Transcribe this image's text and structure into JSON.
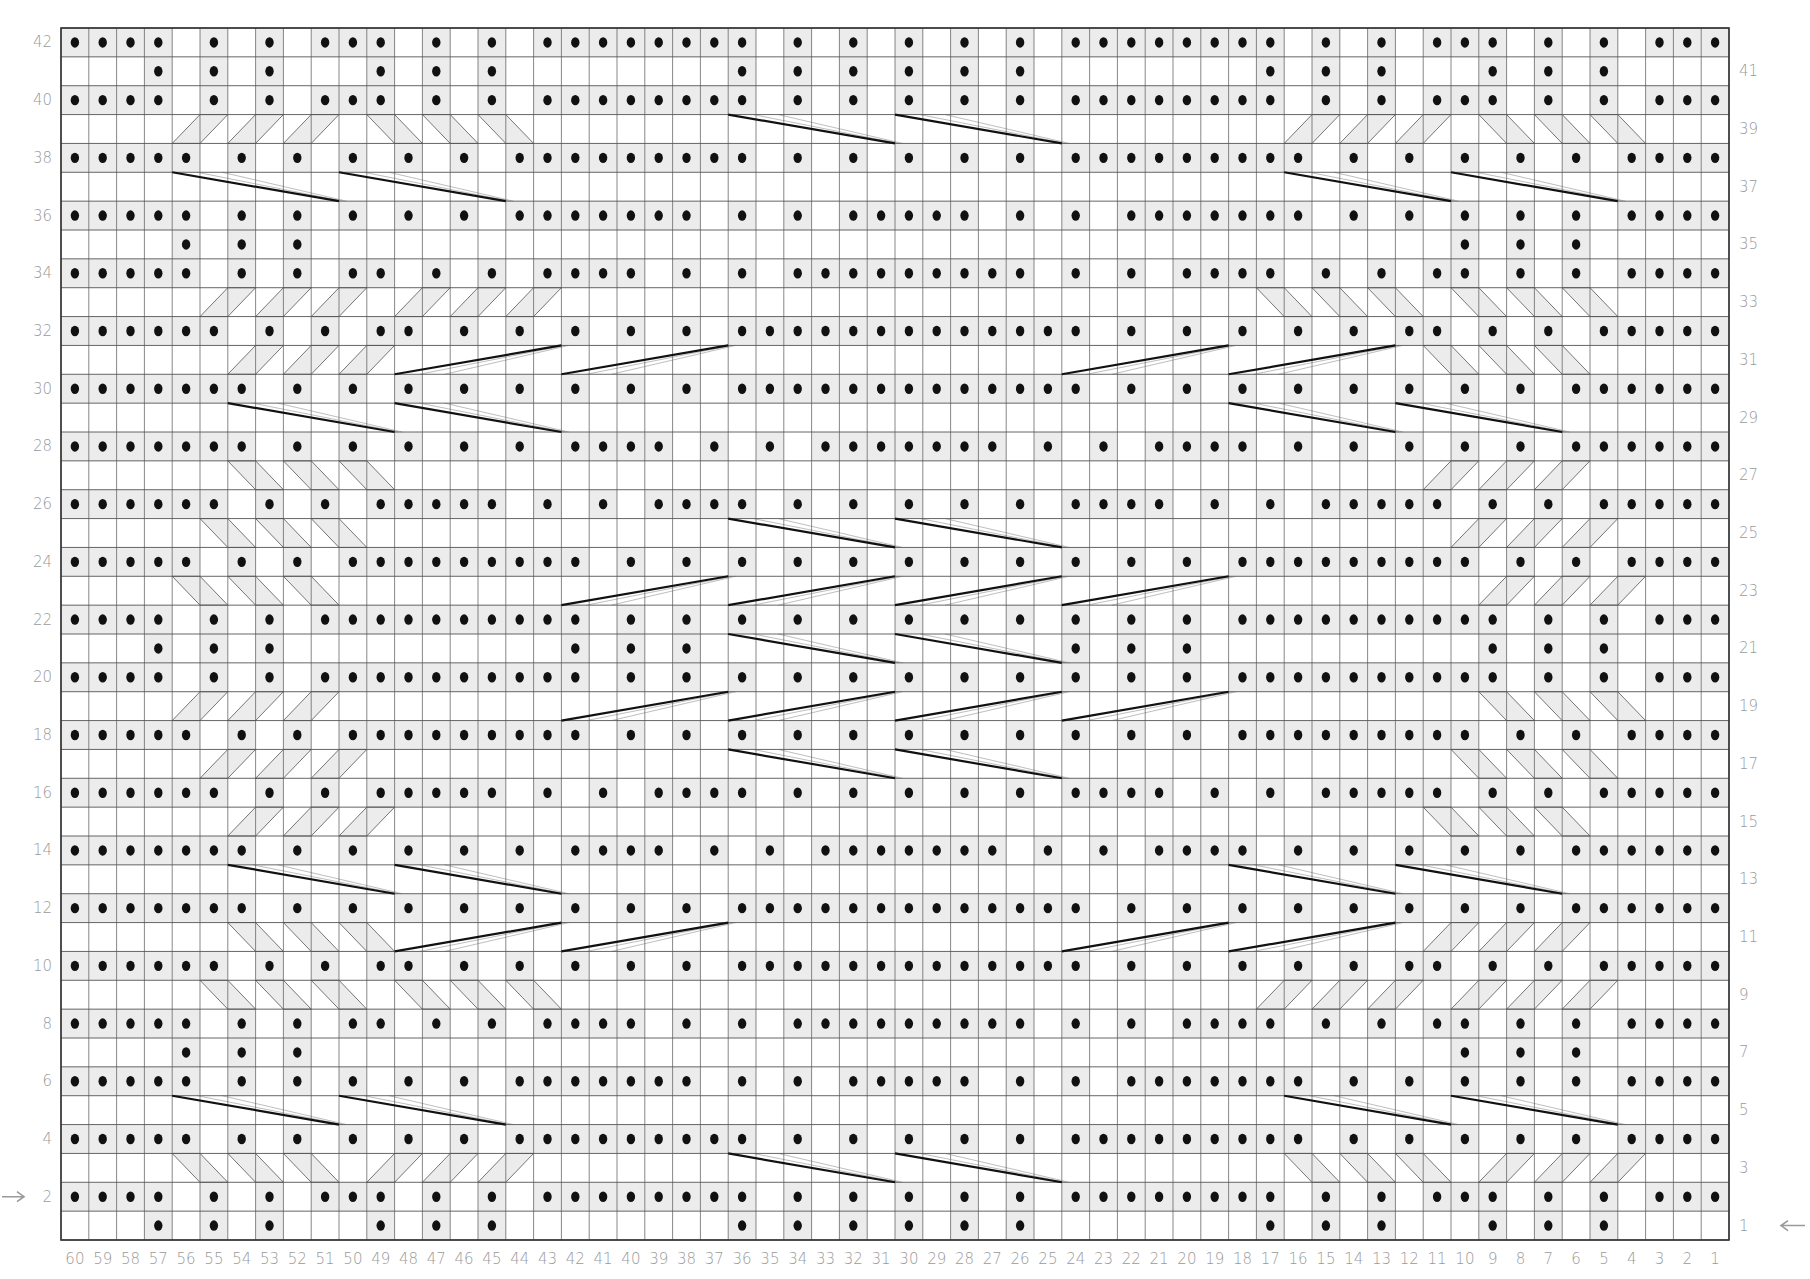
{
  "chart": {
    "type": "knitting-cable-chart",
    "columns": 60,
    "rows": 42,
    "column_labels_order": "60 at left, 1 at right",
    "even_row_labels_side": "left",
    "odd_row_labels_side": "right",
    "start_arrows": [
      {
        "row": 2,
        "side": "left",
        "direction": "right",
        "glyph": "→"
      },
      {
        "row": 1,
        "side": "right",
        "direction": "left",
        "glyph": "←"
      }
    ],
    "colors": {
      "grid_line": "#555555",
      "purl_shade": "#ececec",
      "dot": "#111111",
      "cable_line": "#666666",
      "crossing_line": "#111111",
      "label": "#9a9a9a"
    },
    "symbols": {
      "dot": "purl",
      "blank": "knit",
      "shaded_diagonal_band": "traveling purl stitch",
      "thick_line": "long cable crossing"
    }
  },
  "purl_rows": {
    "42": [
      60,
      59,
      58,
      57,
      55,
      53,
      51,
      50,
      49,
      47,
      45,
      43,
      42,
      41,
      40,
      39,
      38,
      37,
      36,
      34,
      32,
      30,
      28,
      26,
      24,
      23,
      22,
      21,
      20,
      19,
      18,
      17,
      15,
      13,
      11,
      10,
      9,
      7,
      5,
      3,
      2,
      1
    ],
    "41": [
      57,
      55,
      53,
      49,
      47,
      45,
      36,
      34,
      32,
      30,
      28,
      26,
      17,
      15,
      13,
      9,
      7,
      5
    ],
    "40": [
      60,
      59,
      58,
      57,
      55,
      53,
      51,
      50,
      49,
      47,
      45,
      43,
      42,
      41,
      40,
      39,
      38,
      37,
      36,
      34,
      32,
      30,
      28,
      26,
      24,
      23,
      22,
      21,
      20,
      19,
      18,
      17,
      15,
      13,
      11,
      10,
      9,
      7,
      5,
      3,
      2,
      1
    ],
    "39": [],
    "38": [
      60,
      59,
      58,
      57,
      56,
      54,
      52,
      50,
      48,
      46,
      44,
      43,
      42,
      41,
      40,
      39,
      38,
      37,
      36,
      34,
      32,
      30,
      28,
      26,
      24,
      23,
      22,
      21,
      20,
      19,
      18,
      17,
      16,
      14,
      12,
      10,
      8,
      6,
      4,
      3,
      2,
      1
    ],
    "37": [],
    "36": [
      60,
      59,
      58,
      57,
      56,
      54,
      52,
      50,
      48,
      46,
      44,
      43,
      42,
      41,
      40,
      39,
      38,
      36,
      34,
      32,
      31,
      30,
      29,
      28,
      26,
      24,
      22,
      21,
      20,
      19,
      18,
      17,
      16,
      14,
      12,
      10,
      8,
      6,
      4,
      3,
      2,
      1
    ],
    "35": [
      56,
      54,
      52,
      10,
      8,
      6
    ],
    "34": [
      60,
      59,
      58,
      57,
      56,
      54,
      52,
      50,
      49,
      47,
      45,
      43,
      42,
      41,
      40,
      38,
      36,
      34,
      33,
      32,
      31,
      30,
      29,
      28,
      27,
      26,
      24,
      22,
      20,
      19,
      18,
      17,
      15,
      13,
      11,
      10,
      8,
      6,
      4,
      3,
      2,
      1
    ],
    "33": [],
    "32": [
      60,
      59,
      58,
      57,
      56,
      55,
      53,
      51,
      49,
      48,
      46,
      44,
      42,
      40,
      38,
      36,
      35,
      34,
      33,
      32,
      31,
      30,
      29,
      28,
      27,
      26,
      25,
      24,
      22,
      20,
      18,
      16,
      14,
      12,
      11,
      9,
      7,
      5,
      4,
      3,
      2,
      1
    ],
    "31": [],
    "30": [
      60,
      59,
      58,
      57,
      56,
      55,
      54,
      52,
      50,
      48,
      46,
      44,
      42,
      40,
      38,
      36,
      35,
      34,
      33,
      32,
      31,
      30,
      29,
      28,
      27,
      26,
      25,
      24,
      22,
      20,
      18,
      16,
      14,
      12,
      10,
      8,
      6,
      5,
      4,
      3,
      2,
      1
    ],
    "29": [],
    "28": [
      60,
      59,
      58,
      57,
      56,
      55,
      54,
      52,
      50,
      48,
      46,
      44,
      42,
      41,
      40,
      39,
      37,
      35,
      33,
      32,
      31,
      30,
      29,
      28,
      27,
      25,
      23,
      21,
      20,
      19,
      18,
      16,
      14,
      12,
      10,
      8,
      6,
      5,
      4,
      3,
      2,
      1
    ],
    "27": [],
    "26": [
      60,
      59,
      58,
      57,
      56,
      55,
      53,
      51,
      49,
      48,
      47,
      46,
      45,
      43,
      41,
      39,
      38,
      37,
      36,
      34,
      32,
      30,
      28,
      26,
      24,
      23,
      22,
      21,
      19,
      17,
      15,
      14,
      13,
      12,
      11,
      9,
      7,
      5,
      4,
      3,
      2,
      1
    ],
    "25": [],
    "24": [
      60,
      59,
      58,
      57,
      56,
      54,
      52,
      50,
      49,
      48,
      47,
      46,
      45,
      44,
      43,
      42,
      40,
      38,
      36,
      34,
      32,
      30,
      28,
      26,
      24,
      22,
      20,
      18,
      17,
      16,
      15,
      14,
      13,
      12,
      11,
      10,
      8,
      6,
      4,
      3,
      2,
      1
    ],
    "23": [],
    "22": [
      60,
      59,
      58,
      57,
      55,
      53,
      51,
      50,
      49,
      48,
      47,
      46,
      45,
      44,
      43,
      42,
      40,
      38,
      36,
      34,
      32,
      30,
      28,
      26,
      24,
      22,
      20,
      18,
      17,
      16,
      15,
      14,
      13,
      12,
      11,
      10,
      9,
      7,
      5,
      3,
      2,
      1
    ],
    "21": [
      57,
      55,
      53,
      42,
      40,
      38,
      24,
      22,
      20,
      9,
      7,
      5
    ],
    "20": [
      60,
      59,
      58,
      57,
      55,
      53,
      51,
      50,
      49,
      48,
      47,
      46,
      45,
      44,
      43,
      42,
      40,
      38,
      36,
      34,
      32,
      30,
      28,
      26,
      24,
      22,
      20,
      18,
      17,
      16,
      15,
      14,
      13,
      12,
      11,
      10,
      9,
      7,
      5,
      3,
      2,
      1
    ],
    "19": [],
    "18": [
      60,
      59,
      58,
      57,
      56,
      54,
      52,
      50,
      49,
      48,
      47,
      46,
      45,
      44,
      43,
      42,
      40,
      38,
      36,
      34,
      32,
      30,
      28,
      26,
      24,
      22,
      20,
      18,
      17,
      16,
      15,
      14,
      13,
      12,
      11,
      10,
      8,
      6,
      4,
      3,
      2,
      1
    ],
    "17": [],
    "16": [
      60,
      59,
      58,
      57,
      56,
      55,
      53,
      51,
      49,
      48,
      47,
      46,
      45,
      43,
      41,
      39,
      38,
      37,
      36,
      34,
      32,
      30,
      28,
      26,
      24,
      23,
      22,
      21,
      19,
      17,
      15,
      14,
      13,
      12,
      11,
      9,
      7,
      5,
      4,
      3,
      2,
      1
    ],
    "15": [],
    "14": [
      60,
      59,
      58,
      57,
      56,
      55,
      54,
      52,
      50,
      48,
      46,
      44,
      42,
      41,
      40,
      39,
      37,
      35,
      33,
      32,
      31,
      30,
      29,
      28,
      27,
      25,
      23,
      21,
      20,
      19,
      18,
      16,
      14,
      12,
      10,
      8,
      6,
      5,
      4,
      3,
      2,
      1
    ],
    "13": [],
    "12": [
      60,
      59,
      58,
      57,
      56,
      55,
      54,
      52,
      50,
      48,
      46,
      44,
      42,
      40,
      38,
      36,
      35,
      34,
      33,
      32,
      31,
      30,
      29,
      28,
      27,
      26,
      25,
      24,
      22,
      20,
      18,
      16,
      14,
      12,
      10,
      8,
      6,
      5,
      4,
      3,
      2,
      1
    ],
    "11": [],
    "10": [
      60,
      59,
      58,
      57,
      56,
      55,
      53,
      51,
      49,
      48,
      46,
      44,
      42,
      40,
      38,
      36,
      35,
      34,
      33,
      32,
      31,
      30,
      29,
      28,
      27,
      26,
      25,
      24,
      22,
      20,
      18,
      16,
      14,
      12,
      11,
      9,
      7,
      5,
      4,
      3,
      2,
      1
    ],
    "9": [],
    "8": [
      60,
      59,
      58,
      57,
      56,
      54,
      52,
      50,
      49,
      47,
      45,
      43,
      42,
      41,
      40,
      38,
      36,
      34,
      33,
      32,
      31,
      30,
      29,
      28,
      27,
      26,
      24,
      22,
      20,
      19,
      18,
      17,
      15,
      13,
      11,
      10,
      8,
      6,
      4,
      3,
      2,
      1
    ],
    "7": [
      56,
      54,
      52,
      10,
      8,
      6
    ],
    "6": [
      60,
      59,
      58,
      57,
      56,
      54,
      52,
      50,
      48,
      46,
      44,
      43,
      42,
      41,
      40,
      39,
      38,
      36,
      34,
      32,
      31,
      30,
      29,
      28,
      26,
      24,
      22,
      21,
      20,
      19,
      18,
      17,
      16,
      14,
      12,
      10,
      8,
      6,
      4,
      3,
      2,
      1
    ],
    "5": [],
    "4": [
      60,
      59,
      58,
      57,
      56,
      54,
      52,
      50,
      48,
      46,
      44,
      43,
      42,
      41,
      40,
      39,
      38,
      37,
      36,
      34,
      32,
      30,
      28,
      26,
      24,
      23,
      22,
      21,
      20,
      19,
      18,
      17,
      16,
      14,
      12,
      10,
      8,
      6,
      4,
      3,
      2,
      1
    ],
    "3": [],
    "2": [
      60,
      59,
      58,
      57,
      55,
      53,
      51,
      50,
      49,
      47,
      45,
      43,
      42,
      41,
      40,
      39,
      38,
      37,
      36,
      34,
      32,
      30,
      28,
      26,
      24,
      23,
      22,
      21,
      20,
      19,
      18,
      17,
      15,
      13,
      11,
      10,
      9,
      7,
      5,
      3,
      2,
      1
    ],
    "1": [
      57,
      55,
      53,
      49,
      47,
      45,
      36,
      34,
      32,
      30,
      28,
      26,
      17,
      15,
      13,
      9,
      7,
      5
    ]
  },
  "crossings": [
    {
      "row": 39,
      "dir": "down",
      "from_col": 36,
      "to_col": 30
    },
    {
      "row": 39,
      "dir": "down",
      "from_col": 30,
      "to_col": 24
    },
    {
      "row": 37,
      "dir": "down",
      "from_col": 56,
      "to_col": 50
    },
    {
      "row": 37,
      "dir": "down",
      "from_col": 50,
      "to_col": 44
    },
    {
      "row": 37,
      "dir": "down",
      "from_col": 16,
      "to_col": 10
    },
    {
      "row": 37,
      "dir": "down",
      "from_col": 10,
      "to_col": 4
    },
    {
      "row": 31,
      "dir": "up",
      "from_col": 48,
      "to_col": 42
    },
    {
      "row": 31,
      "dir": "up",
      "from_col": 42,
      "to_col": 36
    },
    {
      "row": 31,
      "dir": "up",
      "from_col": 24,
      "to_col": 18
    },
    {
      "row": 31,
      "dir": "up",
      "from_col": 18,
      "to_col": 12
    },
    {
      "row": 29,
      "dir": "down",
      "from_col": 54,
      "to_col": 48
    },
    {
      "row": 29,
      "dir": "down",
      "from_col": 48,
      "to_col": 42
    },
    {
      "row": 29,
      "dir": "down",
      "from_col": 18,
      "to_col": 12
    },
    {
      "row": 29,
      "dir": "down",
      "from_col": 12,
      "to_col": 6
    },
    {
      "row": 25,
      "dir": "down",
      "from_col": 36,
      "to_col": 30
    },
    {
      "row": 25,
      "dir": "down",
      "from_col": 30,
      "to_col": 24
    },
    {
      "row": 23,
      "dir": "up",
      "from_col": 42,
      "to_col": 36
    },
    {
      "row": 23,
      "dir": "up",
      "from_col": 36,
      "to_col": 30
    },
    {
      "row": 23,
      "dir": "up",
      "from_col": 30,
      "to_col": 24
    },
    {
      "row": 23,
      "dir": "up",
      "from_col": 24,
      "to_col": 18
    },
    {
      "row": 21,
      "dir": "down",
      "from_col": 36,
      "to_col": 30
    },
    {
      "row": 21,
      "dir": "down",
      "from_col": 30,
      "to_col": 24
    },
    {
      "row": 19,
      "dir": "up",
      "from_col": 42,
      "to_col": 36
    },
    {
      "row": 19,
      "dir": "up",
      "from_col": 36,
      "to_col": 30
    },
    {
      "row": 19,
      "dir": "up",
      "from_col": 30,
      "to_col": 24
    },
    {
      "row": 19,
      "dir": "up",
      "from_col": 24,
      "to_col": 18
    },
    {
      "row": 17,
      "dir": "down",
      "from_col": 36,
      "to_col": 30
    },
    {
      "row": 17,
      "dir": "down",
      "from_col": 30,
      "to_col": 24
    },
    {
      "row": 13,
      "dir": "down",
      "from_col": 54,
      "to_col": 48
    },
    {
      "row": 13,
      "dir": "down",
      "from_col": 48,
      "to_col": 42
    },
    {
      "row": 13,
      "dir": "down",
      "from_col": 18,
      "to_col": 12
    },
    {
      "row": 13,
      "dir": "down",
      "from_col": 12,
      "to_col": 6
    },
    {
      "row": 11,
      "dir": "up",
      "from_col": 48,
      "to_col": 42
    },
    {
      "row": 11,
      "dir": "up",
      "from_col": 42,
      "to_col": 36
    },
    {
      "row": 11,
      "dir": "up",
      "from_col": 24,
      "to_col": 18
    },
    {
      "row": 11,
      "dir": "up",
      "from_col": 18,
      "to_col": 12
    },
    {
      "row": 5,
      "dir": "down",
      "from_col": 56,
      "to_col": 50
    },
    {
      "row": 5,
      "dir": "down",
      "from_col": 50,
      "to_col": 44
    },
    {
      "row": 5,
      "dir": "down",
      "from_col": 16,
      "to_col": 10
    },
    {
      "row": 5,
      "dir": "down",
      "from_col": 10,
      "to_col": 4
    },
    {
      "row": 3,
      "dir": "down",
      "from_col": 36,
      "to_col": 30
    },
    {
      "row": 3,
      "dir": "down",
      "from_col": 30,
      "to_col": 24
    }
  ],
  "axis": {
    "bottom_labels": [
      "60",
      "59",
      "58",
      "57",
      "56",
      "55",
      "54",
      "53",
      "52",
      "51",
      "50",
      "49",
      "48",
      "47",
      "46",
      "45",
      "44",
      "43",
      "42",
      "41",
      "40",
      "39",
      "38",
      "37",
      "36",
      "35",
      "34",
      "33",
      "32",
      "31",
      "30",
      "29",
      "28",
      "27",
      "26",
      "25",
      "24",
      "23",
      "22",
      "21",
      "20",
      "19",
      "18",
      "17",
      "16",
      "15",
      "14",
      "13",
      "12",
      "11",
      "10",
      "9",
      "8",
      "7",
      "6",
      "5",
      "4",
      "3",
      "2",
      "1"
    ],
    "left_labels": [
      "42",
      "40",
      "38",
      "36",
      "34",
      "32",
      "30",
      "28",
      "26",
      "24",
      "22",
      "20",
      "18",
      "16",
      "14",
      "12",
      "10",
      "8",
      "6",
      "4",
      "2"
    ],
    "right_labels": [
      "41",
      "39",
      "37",
      "35",
      "33",
      "31",
      "29",
      "27",
      "25",
      "23",
      "21",
      "19",
      "17",
      "15",
      "13",
      "11",
      "9",
      "7",
      "5",
      "3",
      "1"
    ]
  }
}
